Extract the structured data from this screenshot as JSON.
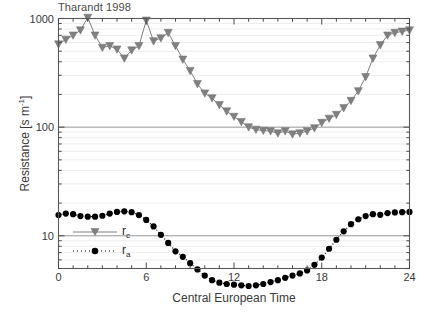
{
  "chart_data": {
    "type": "line",
    "title": "Tharandt 1998",
    "xlabel": "Central European Time",
    "ylabel": "Resistance [s m-1]",
    "ylabel_base": "Resistance [s m",
    "ylabel_exp": "-1",
    "ylabel_tail": "]",
    "yscale": "log",
    "ylim": [
      5,
      1000
    ],
    "xlim": [
      0,
      24
    ],
    "xticks": [
      0,
      6,
      12,
      18,
      24
    ],
    "xtick_labels": [
      "0",
      "6",
      "12",
      "18",
      "24"
    ],
    "yticks": [
      10,
      100,
      1000
    ],
    "ytick_labels": [
      "10",
      "100",
      "1000"
    ],
    "x_minor_tick_interval": 1,
    "grid": "horizontal minor log gridlines, light gray",
    "legend_position": "lower left inside axes",
    "series": [
      {
        "name": "rc",
        "label": "r_c",
        "label_base": "r",
        "label_sub": "c",
        "color": "#808080",
        "marker": "triangle-down",
        "linestyle": "solid",
        "x": [
          0.0,
          0.5,
          1.0,
          1.5,
          2.0,
          2.5,
          3.0,
          3.5,
          4.0,
          4.5,
          5.0,
          5.5,
          6.0,
          6.5,
          7.0,
          7.5,
          8.0,
          8.5,
          9.0,
          9.5,
          10.0,
          10.5,
          11.0,
          11.5,
          12.0,
          12.5,
          13.0,
          13.5,
          14.0,
          14.5,
          15.0,
          15.5,
          16.0,
          16.5,
          17.0,
          17.5,
          18.0,
          18.5,
          19.0,
          19.5,
          20.0,
          20.5,
          21.0,
          21.5,
          22.0,
          22.5,
          23.0,
          23.5,
          24.0
        ],
        "values": [
          580,
          640,
          700,
          780,
          1020,
          700,
          540,
          560,
          520,
          430,
          510,
          560,
          960,
          620,
          660,
          740,
          560,
          420,
          330,
          250,
          205,
          185,
          160,
          140,
          125,
          112,
          100,
          95,
          93,
          92,
          88,
          92,
          86,
          88,
          92,
          98,
          110,
          120,
          130,
          150,
          175,
          215,
          290,
          430,
          570,
          700,
          740,
          760,
          780
        ]
      },
      {
        "name": "ra",
        "label": "r_a",
        "label_base": "r",
        "label_sub": "a",
        "color": "#000000",
        "marker": "circle",
        "linestyle": "dotted",
        "x": [
          0.0,
          0.5,
          1.0,
          1.5,
          2.0,
          2.5,
          3.0,
          3.5,
          4.0,
          4.5,
          5.0,
          5.5,
          6.0,
          6.5,
          7.0,
          7.5,
          8.0,
          8.5,
          9.0,
          9.5,
          10.0,
          10.5,
          11.0,
          11.5,
          12.0,
          12.5,
          13.0,
          13.5,
          14.0,
          14.5,
          15.0,
          15.5,
          16.0,
          16.5,
          17.0,
          17.5,
          18.0,
          18.5,
          19.0,
          19.5,
          20.0,
          20.5,
          21.0,
          21.5,
          22.0,
          22.5,
          23.0,
          23.5,
          24.0
        ],
        "values": [
          15.5,
          16.0,
          15.8,
          15.2,
          15.0,
          15.0,
          15.3,
          16.0,
          16.6,
          16.8,
          16.5,
          15.5,
          14.0,
          12.2,
          10.2,
          8.6,
          7.2,
          6.4,
          5.6,
          4.9,
          4.3,
          3.9,
          3.7,
          3.6,
          3.55,
          3.5,
          3.45,
          3.5,
          3.6,
          3.75,
          3.9,
          4.1,
          4.3,
          4.5,
          4.8,
          5.4,
          6.3,
          7.6,
          9.2,
          11.0,
          12.8,
          14.2,
          15.2,
          15.8,
          15.6,
          16.2,
          16.4,
          16.5,
          16.6
        ]
      }
    ]
  },
  "legend": {
    "entries": [
      {
        "label_base": "r",
        "label_sub": "c",
        "series": "rc"
      },
      {
        "label_base": "r",
        "label_sub": "a",
        "series": "ra"
      }
    ]
  }
}
